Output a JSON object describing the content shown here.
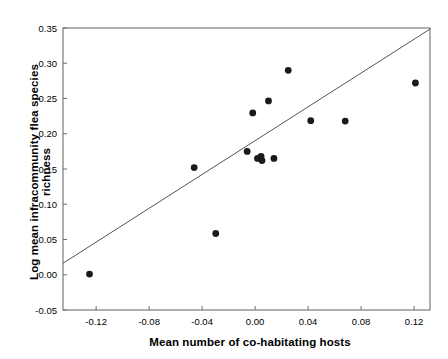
{
  "chart_data": {
    "type": "scatter",
    "title": "",
    "xlabel": "Mean number of co-habitating hosts",
    "ylabel": "Log mean infracommunity flea species richness",
    "xlim": [
      -0.145,
      0.132
    ],
    "ylim": [
      -0.05,
      0.35
    ],
    "xticks": [
      -0.12,
      -0.08,
      -0.04,
      0.0,
      0.04,
      0.08,
      0.12
    ],
    "xticklabels": [
      "-0.12",
      "-0.08",
      "-0.04",
      "0.00",
      "0.04",
      "0.08",
      "0.12"
    ],
    "yticks": [
      -0.05,
      0.0,
      0.05,
      0.1,
      0.15,
      0.2,
      0.25,
      0.3,
      0.35
    ],
    "yticklabels": [
      "-0.05",
      "0.00",
      "0.05",
      "0.10",
      "0.15",
      "0.20",
      "0.25",
      "0.30",
      "0.35"
    ],
    "grid": false,
    "legend": false,
    "marker_color": "#1a1a1a",
    "marker_size": 4.4,
    "line_color": "#555555",
    "axis_color": "#6e6e6e",
    "points": [
      {
        "x": -0.125,
        "y": 0.001
      },
      {
        "x": -0.046,
        "y": 0.152
      },
      {
        "x": -0.0297,
        "y": 0.0585
      },
      {
        "x": -0.006,
        "y": 0.175
      },
      {
        "x": -0.0018,
        "y": 0.2295
      },
      {
        "x": 0.0018,
        "y": 0.165
      },
      {
        "x": 0.0045,
        "y": 0.168
      },
      {
        "x": 0.0052,
        "y": 0.162
      },
      {
        "x": 0.0101,
        "y": 0.2465
      },
      {
        "x": 0.0142,
        "y": 0.165
      },
      {
        "x": 0.025,
        "y": 0.29
      },
      {
        "x": 0.042,
        "y": 0.2185
      },
      {
        "x": 0.068,
        "y": 0.218
      },
      {
        "x": 0.121,
        "y": 0.272
      }
    ],
    "trendline": {
      "x0": -0.145,
      "y0": 0.0163,
      "x1": 0.132,
      "y1": 0.3485
    }
  }
}
